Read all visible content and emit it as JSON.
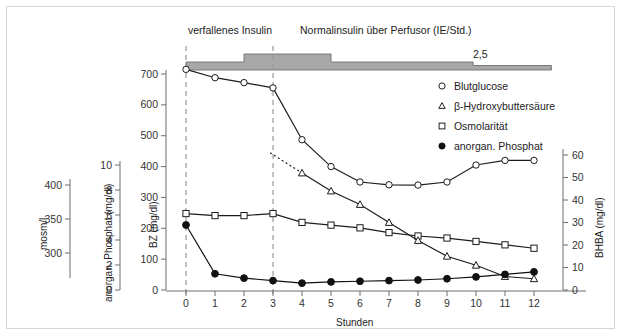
{
  "figure": {
    "background": "#ffffff",
    "frame_color": "#d6d6d6"
  },
  "annotations": {
    "left_phase_label": "verfallenes Insulin",
    "right_phase_label": "Normalinsulin über Perfusor (IE/Std.)",
    "rate_value_label": "2,5",
    "bar_color": "#a8a8a8",
    "bar_edge_color": "#6f6f6f",
    "marker_line_1_hour": 0,
    "marker_line_2_hour": 3
  },
  "legend": {
    "position": "top-right-inside",
    "items": [
      {
        "label": "Blutglucose",
        "marker": "open-circle",
        "icon": "circle-open-icon"
      },
      {
        "label": "β-Hydroxybuttersäure",
        "marker": "open-triangle",
        "icon": "triangle-open-icon"
      },
      {
        "label": "Osmolarität",
        "marker": "open-square",
        "icon": "square-open-icon"
      },
      {
        "label": "anorgan. Phosphat",
        "marker": "filled-circle",
        "icon": "circle-filled-icon"
      }
    ]
  },
  "chart_data": {
    "type": "line",
    "title": "",
    "xlabel": "Stunden",
    "x": [
      0,
      1,
      2,
      3,
      4,
      5,
      6,
      7,
      8,
      9,
      10,
      11,
      12
    ],
    "xlim": [
      0,
      12
    ],
    "grid": false,
    "axes": [
      {
        "id": "mosm",
        "name": "mosm/l",
        "side": "left",
        "ylabel": "mosm/l",
        "ticks": [
          300,
          350,
          400
        ],
        "ylim": [
          285,
          415
        ]
      },
      {
        "id": "phosphat",
        "name": "anorgan. Phosphat (mg/dl)",
        "side": "left",
        "ylabel": "anorgan. Phosphat (mg/dl)",
        "ticks": [
          0,
          2,
          4,
          6,
          8,
          10
        ],
        "ylim": [
          0,
          10
        ]
      },
      {
        "id": "bz",
        "name": "BZ (mg/dl)",
        "side": "left",
        "ylabel": "BZ (mg/dl)",
        "ticks": [
          0,
          100,
          200,
          300,
          400,
          500,
          600,
          700
        ],
        "ylim": [
          0,
          700
        ]
      },
      {
        "id": "bhba",
        "name": "BHBA (mg/dl)",
        "side": "right",
        "ylabel": "BHBA (mg/dl)",
        "ticks": [
          0,
          10,
          20,
          30,
          40,
          50,
          60
        ],
        "ylim": [
          0,
          60
        ]
      }
    ],
    "series": [
      {
        "name": "Blutglucose",
        "axis": "bz",
        "unit": "mg/dl",
        "marker": "open-circle",
        "color": "#1c1c1c",
        "x": [
          0,
          1,
          2,
          3,
          4,
          5,
          6,
          7,
          8,
          9,
          10,
          11,
          12
        ],
        "values": [
          715,
          688,
          672,
          655,
          487,
          400,
          350,
          341,
          340,
          350,
          405,
          420,
          420
        ]
      },
      {
        "name": "Osmolarität",
        "axis": "mosm",
        "unit": "mosm/l",
        "marker": "open-square",
        "color": "#1c1c1c",
        "x": [
          0,
          1,
          2,
          3,
          4,
          5,
          6,
          7,
          8,
          9,
          10,
          11,
          12
        ],
        "values": [
          358,
          355,
          355,
          358,
          345,
          341,
          337,
          330,
          325,
          322,
          317,
          312,
          307
        ]
      },
      {
        "name": "β-Hydroxybuttersäure",
        "axis": "bhba",
        "unit": "mg/dl",
        "marker": "open-triangle",
        "color": "#1c1c1c",
        "leading_segment_style": "dotted",
        "x": [
          4,
          5,
          6,
          7,
          8,
          9,
          10,
          11,
          12
        ],
        "values": [
          52,
          44,
          38,
          30,
          22,
          15,
          11,
          6,
          5
        ]
      },
      {
        "name": "anorgan. Phosphat",
        "axis": "phosphat",
        "unit": "mg/dl",
        "marker": "filled-circle",
        "color": "#111111",
        "x": [
          0,
          1,
          2,
          3,
          4,
          5,
          6,
          7,
          8,
          9,
          10,
          11,
          12
        ],
        "values": [
          5.2,
          1.3,
          0.95,
          0.75,
          0.55,
          0.65,
          0.7,
          0.75,
          0.8,
          0.9,
          1.05,
          1.25,
          1.45
        ]
      }
    ],
    "insulin_bar": {
      "label_units": "IE/Std.",
      "steps": [
        {
          "from_hour": 0,
          "to_hour": 2,
          "level": 1
        },
        {
          "from_hour": 2,
          "to_hour": 5,
          "level": 2
        },
        {
          "from_hour": 5,
          "to_hour": 9.9,
          "level": 1
        },
        {
          "from_hour": 9.9,
          "to_hour": 12.6,
          "level": 0.5
        }
      ]
    }
  }
}
